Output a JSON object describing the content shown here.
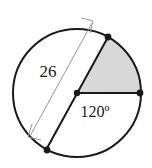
{
  "figure": {
    "type": "circle-sector-diagram",
    "canvas": {
      "width": 152,
      "height": 168,
      "background": "#ffffff"
    },
    "colors": {
      "stroke": "#1a1a1a",
      "sector_fill": "#d8d8d8",
      "dimension_line": "#8c8c8c",
      "text": "#1a1a1a"
    },
    "circle": {
      "center_x": 77,
      "center_y": 93,
      "radius": 64,
      "stroke_width": 2
    },
    "points": [
      {
        "name": "center",
        "x": 77,
        "y": 93
      },
      {
        "name": "sector-start-upper-right",
        "x": 108,
        "y": 37
      },
      {
        "name": "sector-end-right",
        "x": 141,
        "y": 93
      },
      {
        "name": "diameter-end-lower-left",
        "x": 46,
        "y": 150
      }
    ],
    "sector": {
      "angle_label": "120º",
      "angle_value": 120,
      "fill": "#d8d8d8"
    },
    "diameter": {
      "length_label": "26",
      "length_value": 26
    },
    "labels": {
      "diameter": "26",
      "angle": "120º"
    }
  }
}
